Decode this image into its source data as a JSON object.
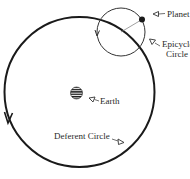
{
  "labels": {
    "planet": "Planet",
    "epicycle_line1": "Epicycle",
    "epicycle_line2": "Circle",
    "earth": "Earth",
    "deferent": "Deferent Circle"
  },
  "icons": {
    "pointer": "triangle-pointer-icon",
    "planet": "filled-dot",
    "earth": "striped-globe"
  },
  "colors": {
    "line": "#1a1a1a",
    "thin_line": "#555555",
    "background": "#ffffff"
  }
}
